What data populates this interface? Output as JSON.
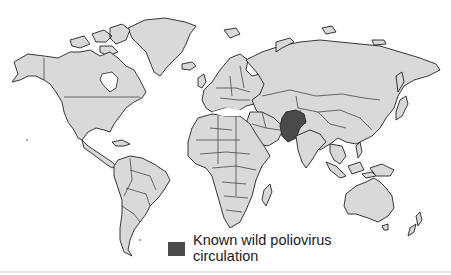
{
  "map": {
    "title": "",
    "type": "world-choropleth",
    "base_color": "#d9d9d9",
    "border_color": "#222222",
    "highlight_color": "#4a4a4a",
    "highlighted_regions": [
      "Afghanistan",
      "Pakistan"
    ]
  },
  "legend": {
    "items": [
      {
        "swatch_color": "#4a4a4a",
        "label_line1": "Known wild poliovirus",
        "label_line2": "circulation"
      }
    ]
  }
}
